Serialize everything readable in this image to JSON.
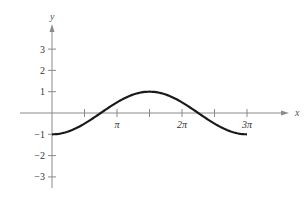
{
  "chart_data": {
    "type": "line",
    "title": "",
    "xlabel": "x",
    "ylabel": "y",
    "function": "y = -cos(2x/3)",
    "x_ticks": [
      {
        "value": 1.5708,
        "label": ""
      },
      {
        "value": 3.1416,
        "label": "π"
      },
      {
        "value": 4.7124,
        "label": ""
      },
      {
        "value": 6.2832,
        "label": "2π"
      },
      {
        "value": 7.854,
        "label": ""
      },
      {
        "value": 9.4248,
        "label": "3π"
      }
    ],
    "y_ticks": [
      {
        "value": 3,
        "label": "3"
      },
      {
        "value": 2,
        "label": "2"
      },
      {
        "value": 1,
        "label": "1"
      },
      {
        "value": -1,
        "label": "−1"
      },
      {
        "value": -2,
        "label": "−2"
      },
      {
        "value": -3,
        "label": "−3"
      }
    ],
    "series": [
      {
        "name": "curve",
        "x": [
          0,
          1.5708,
          2.3562,
          3.1416,
          4.7124,
          6.2832,
          7.0686,
          7.854,
          9.4248
        ],
        "values": [
          -1,
          -0.5,
          0,
          0.5,
          1,
          0.5,
          0,
          -0.5,
          -1
        ]
      }
    ],
    "xlim": [
      -1.0,
      11.0
    ],
    "ylim": [
      -3.5,
      3.8
    ],
    "grid": false,
    "legend": null
  },
  "colors": {
    "axis": "#8a8a8a",
    "curve": "#1a1a1a",
    "text": "#333333"
  }
}
